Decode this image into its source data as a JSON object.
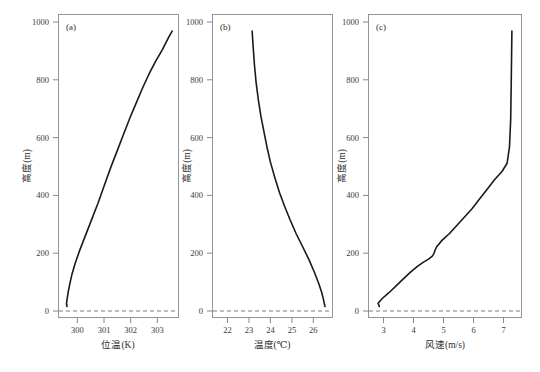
{
  "figure": {
    "background": "#ffffff",
    "curve_color": "#1a1a1a",
    "frame_color": "#8a8a8a",
    "zero_line_color": "#6e6e6e",
    "caption": "",
    "caption_truncated": true
  },
  "panels": {
    "a": {
      "tag": "(a)",
      "xlabel": "位温(K)",
      "ylabel": "高度(m)",
      "xticks": [
        "300",
        "301",
        "302",
        "303"
      ],
      "yticks": [
        "0",
        "200",
        "400",
        "600",
        "800",
        "1000"
      ]
    },
    "b": {
      "tag": "(b)",
      "xlabel": "温度(℃)",
      "ylabel": "高度(m)",
      "xticks": [
        "22",
        "23",
        "24",
        "25",
        "26"
      ],
      "yticks": [
        "0",
        "200",
        "400",
        "600",
        "800",
        "1000"
      ]
    },
    "c": {
      "tag": "(c)",
      "xlabel": "风速(m/s)",
      "ylabel": "高度(m)",
      "xticks": [
        "3",
        "4",
        "5",
        "6",
        "7"
      ],
      "yticks": [
        "0",
        "200",
        "400",
        "600",
        "800",
        "1000"
      ]
    }
  },
  "chart_data": [
    {
      "type": "line",
      "panel": "a",
      "title": "(a)",
      "xlabel": "位温(K)",
      "ylabel": "高度(m)",
      "xlim": [
        299.3,
        303.8
      ],
      "ylim": [
        -40,
        1060
      ],
      "xticks": [
        300,
        301,
        302,
        303
      ],
      "yticks": [
        0,
        200,
        400,
        600,
        800,
        1000
      ],
      "grid": false,
      "legend": null,
      "annotations": [
        {
          "text": "零线 (dashed reference at 0 m)",
          "y": 0,
          "style": "dashed"
        }
      ],
      "series": [
        {
          "name": "位温廓线",
          "x": [
            299.62,
            299.6,
            299.62,
            299.66,
            299.72,
            299.8,
            299.92,
            300.08,
            300.28,
            300.52,
            300.78,
            301.02,
            301.26,
            301.5,
            301.74,
            301.98,
            302.22,
            302.46,
            302.7,
            302.94,
            303.18,
            303.42,
            303.56
          ],
          "y": [
            0,
            10,
            25,
            50,
            80,
            115,
            155,
            200,
            250,
            310,
            375,
            440,
            505,
            565,
            625,
            685,
            740,
            795,
            845,
            890,
            930,
            975,
            1000
          ]
        }
      ]
    },
    {
      "type": "line",
      "panel": "b",
      "title": "(b)",
      "xlabel": "温度(℃)",
      "ylabel": "高度(m)",
      "xlim": [
        21.3,
        26.9
      ],
      "ylim": [
        -40,
        1060
      ],
      "xticks": [
        22,
        23,
        24,
        25,
        26
      ],
      "yticks": [
        0,
        200,
        400,
        600,
        800,
        1000
      ],
      "grid": false,
      "legend": null,
      "annotations": [
        {
          "text": "零线 (dashed reference at 0 m)",
          "y": 0,
          "style": "dashed"
        }
      ],
      "series": [
        {
          "name": "温度廓线",
          "x": [
            26.55,
            26.52,
            26.48,
            26.4,
            26.25,
            26.05,
            25.8,
            25.52,
            25.2,
            24.92,
            24.66,
            24.42,
            24.2,
            24.0,
            23.84,
            23.7,
            23.56,
            23.44,
            23.34,
            23.26,
            23.2,
            23.15
          ],
          "y": [
            0,
            10,
            25,
            50,
            85,
            125,
            170,
            215,
            265,
            315,
            365,
            415,
            470,
            525,
            580,
            635,
            690,
            750,
            810,
            875,
            940,
            1000
          ]
        }
      ]
    },
    {
      "type": "line",
      "panel": "c",
      "title": "(c)",
      "xlabel": "风速(m/s)",
      "ylabel": "高度(m)",
      "xlim": [
        2.5,
        7.6
      ],
      "ylim": [
        -40,
        1060
      ],
      "xticks": [
        3,
        4,
        5,
        6,
        7
      ],
      "yticks": [
        0,
        200,
        400,
        600,
        800,
        1000
      ],
      "grid": false,
      "legend": null,
      "annotations": [
        {
          "text": "零线 (dashed reference at 0 m)",
          "y": 0,
          "style": "dashed"
        }
      ],
      "series": [
        {
          "name": "风速廓线",
          "x": [
            2.86,
            2.82,
            2.95,
            3.18,
            3.42,
            3.66,
            3.9,
            4.12,
            4.32,
            4.5,
            4.62,
            4.68,
            4.72,
            4.78,
            4.95,
            5.2,
            5.45,
            5.7,
            5.95,
            6.2,
            6.45,
            6.7,
            6.95,
            7.12,
            7.2,
            7.24,
            7.26,
            7.28
          ],
          "y": [
            0,
            12,
            28,
            50,
            75,
            100,
            125,
            145,
            160,
            172,
            182,
            192,
            205,
            218,
            240,
            265,
            295,
            325,
            355,
            390,
            425,
            460,
            490,
            520,
            580,
            680,
            830,
            1000
          ]
        }
      ]
    }
  ]
}
